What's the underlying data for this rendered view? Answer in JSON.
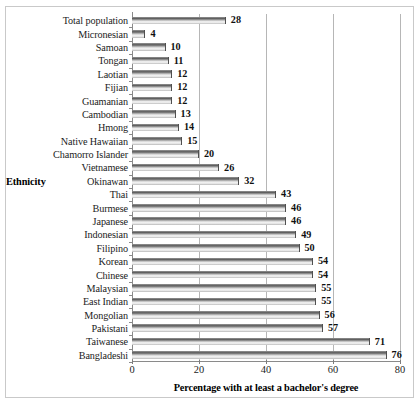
{
  "chart_data": {
    "type": "bar",
    "orientation": "horizontal",
    "title": "",
    "xlabel": "Percentage with at least a bachelor's degree",
    "ylabel": "Ethnicity",
    "xlim": [
      0,
      80
    ],
    "xticks": [
      0,
      20,
      40,
      60,
      80
    ],
    "grid": true,
    "legend": false,
    "categories": [
      "Total population",
      "Micronesian",
      "Samoan",
      "Tongan",
      "Laotian",
      "Fijian",
      "Guamanian",
      "Cambodian",
      "Hmong",
      "Native Hawaiian",
      "Chamorro Islander",
      "Vietnamese",
      "Okinawan",
      "Thai",
      "Burmese",
      "Japanese",
      "Indonesian",
      "Filipino",
      "Korean",
      "Chinese",
      "Malaysian",
      "East Indian",
      "Mongolian",
      "Pakistani",
      "Taiwanese",
      "Bangladeshi"
    ],
    "values": [
      28,
      4,
      10,
      11,
      12,
      12,
      12,
      13,
      14,
      15,
      20,
      26,
      32,
      43,
      46,
      46,
      49,
      50,
      54,
      54,
      55,
      55,
      56,
      57,
      71,
      76
    ],
    "value_labels": [
      "28",
      "4",
      "10",
      "11",
      "12",
      "12",
      "12",
      "13",
      "14",
      "15",
      "20",
      "26",
      "32",
      "43",
      "46",
      "46",
      "49",
      "50",
      "54",
      "54",
      "55",
      "55",
      "56",
      "57",
      "71",
      "76"
    ],
    "xtick_labels": [
      "0",
      "20",
      "40",
      "60",
      "80"
    ],
    "colors": {
      "bar_fill_light": "#f4f4f4",
      "bar_fill_dark": "#5c5c5c",
      "bar_edge": "#4f4f4f",
      "gridline": "#b6b6b6",
      "axis": "#8a8a8a",
      "text": "#101010",
      "frame": "#c9c9c9",
      "background": "#ffffff"
    }
  }
}
